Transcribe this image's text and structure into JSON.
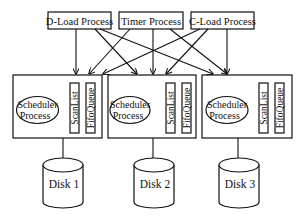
{
  "diagram": {
    "top_processes": [
      {
        "id": "dload",
        "label": "D-Load Process"
      },
      {
        "id": "timer",
        "label": "Timer Process"
      },
      {
        "id": "cload",
        "label": "C-Load Process"
      }
    ],
    "scheduler_units": [
      {
        "id": "unit1",
        "scheduler_label_line1": "Scheduler",
        "scheduler_label_line2": "Process",
        "scanlist_label": "ScanList",
        "fifoqueue_label": "FifoQueue",
        "disk_label": "Disk 1"
      },
      {
        "id": "unit2",
        "scheduler_label_line1": "Scheduler",
        "scheduler_label_line2": "Process",
        "scanlist_label": "ScanList",
        "fifoqueue_label": "FifoQueue",
        "disk_label": "Disk 2"
      },
      {
        "id": "unit3",
        "scheduler_label_line1": "Scheduler",
        "scheduler_label_line2": "Process",
        "scanlist_label": "ScanList",
        "fifoqueue_label": "FifoQueue",
        "disk_label": "Disk 3"
      }
    ],
    "edges": [
      {
        "from": "D-Load Process",
        "to": "unit1"
      },
      {
        "from": "D-Load Process",
        "to": "unit2"
      },
      {
        "from": "D-Load Process",
        "to": "unit3"
      },
      {
        "from": "Timer Process",
        "to": "unit1"
      },
      {
        "from": "Timer Process",
        "to": "unit2"
      },
      {
        "from": "Timer Process",
        "to": "unit3"
      },
      {
        "from": "C-Load Process",
        "to": "unit1"
      },
      {
        "from": "C-Load Process",
        "to": "unit2"
      },
      {
        "from": "C-Load Process",
        "to": "unit3"
      },
      {
        "from": "unit1",
        "to": "Disk 1"
      },
      {
        "from": "unit2",
        "to": "Disk 2"
      },
      {
        "from": "unit3",
        "to": "Disk 3"
      }
    ]
  }
}
